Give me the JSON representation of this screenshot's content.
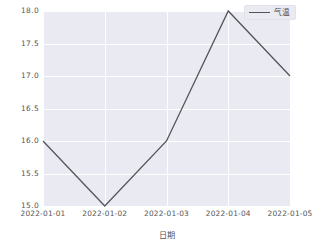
{
  "chart_data": {
    "type": "line",
    "title": "",
    "xlabel": "日期",
    "ylabel": "",
    "categories": [
      "2022-01-01",
      "2022-01-02",
      "2022-01-03",
      "2022-01-04",
      "2022-01-05"
    ],
    "series": [
      {
        "name": "气温",
        "values": [
          16.0,
          15.0,
          16.0,
          18.0,
          17.0
        ],
        "color": "#555559"
      }
    ],
    "ylim": [
      15.0,
      18.0
    ],
    "yticks": [
      "15.0",
      "15.5",
      "16.0",
      "16.5",
      "17.0",
      "17.5",
      "18.0"
    ],
    "ytick_values": [
      15.0,
      15.5,
      16.0,
      16.5,
      17.0,
      17.5,
      18.0
    ],
    "grid": true,
    "grid_color": "#ffffff",
    "plot_background": "#eaeaf2",
    "figure_background": "#ffffff",
    "legend": {
      "position": "upper right",
      "entries": [
        "气温"
      ]
    }
  },
  "axis": {
    "x": {
      "label": "日期",
      "ticks": [
        "2022-01-01",
        "2022-01-02",
        "2022-01-03",
        "2022-01-04",
        "2022-01-05"
      ]
    },
    "y": {
      "label": "",
      "ticks": [
        "15.0",
        "15.5",
        "16.0",
        "16.5",
        "17.0",
        "17.5",
        "18.0"
      ]
    }
  },
  "legend": {
    "label": "气温"
  }
}
